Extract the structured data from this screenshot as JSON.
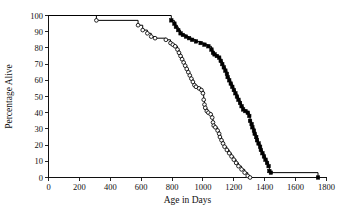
{
  "figure": {
    "background_color": "#ffffff",
    "foreground_color": "#101010"
  },
  "chart_data": {
    "type": "line",
    "title": "",
    "subtitle": "",
    "xlabel": "Age in Days",
    "ylabel": "Percentage Alive",
    "xlim": [
      0,
      1800
    ],
    "ylim": [
      0,
      100
    ],
    "xticks": [
      0,
      200,
      400,
      600,
      800,
      1000,
      1200,
      1400,
      1600,
      1800
    ],
    "yticks": [
      0,
      10,
      20,
      30,
      40,
      50,
      60,
      70,
      80,
      90,
      100
    ],
    "xtick_labels": [
      "0",
      "200",
      "400",
      "600",
      "800",
      "1000",
      "1200",
      "1400",
      "1600",
      "1800"
    ],
    "ytick_labels": [
      "0",
      "10",
      "20",
      "30",
      "40",
      "50",
      "60",
      "70",
      "80",
      "90",
      "100"
    ],
    "grid": false,
    "legend": null,
    "legend_position": "none",
    "annotations": [],
    "series": [
      {
        "name": "Open circles group",
        "marker": "open-circle",
        "line_color": "#000000",
        "marker_fill": "#ffffff",
        "points": [
          {
            "x": 0,
            "y": 100
          },
          {
            "x": 310,
            "y": 97
          },
          {
            "x": 580,
            "y": 94
          },
          {
            "x": 610,
            "y": 91
          },
          {
            "x": 640,
            "y": 89
          },
          {
            "x": 665,
            "y": 87
          },
          {
            "x": 690,
            "y": 86
          },
          {
            "x": 760,
            "y": 85
          },
          {
            "x": 790,
            "y": 83
          },
          {
            "x": 805,
            "y": 82
          },
          {
            "x": 820,
            "y": 81
          },
          {
            "x": 835,
            "y": 79
          },
          {
            "x": 845,
            "y": 77
          },
          {
            "x": 855,
            "y": 75
          },
          {
            "x": 865,
            "y": 73
          },
          {
            "x": 875,
            "y": 71
          },
          {
            "x": 885,
            "y": 69
          },
          {
            "x": 895,
            "y": 67
          },
          {
            "x": 905,
            "y": 65
          },
          {
            "x": 915,
            "y": 63
          },
          {
            "x": 925,
            "y": 61
          },
          {
            "x": 935,
            "y": 59
          },
          {
            "x": 945,
            "y": 57
          },
          {
            "x": 955,
            "y": 56
          },
          {
            "x": 975,
            "y": 55
          },
          {
            "x": 990,
            "y": 54
          },
          {
            "x": 1000,
            "y": 52
          },
          {
            "x": 1005,
            "y": 48
          },
          {
            "x": 1010,
            "y": 45
          },
          {
            "x": 1015,
            "y": 43
          },
          {
            "x": 1025,
            "y": 41
          },
          {
            "x": 1035,
            "y": 40
          },
          {
            "x": 1050,
            "y": 39
          },
          {
            "x": 1060,
            "y": 37
          },
          {
            "x": 1065,
            "y": 34
          },
          {
            "x": 1070,
            "y": 32
          },
          {
            "x": 1080,
            "y": 31
          },
          {
            "x": 1095,
            "y": 29
          },
          {
            "x": 1105,
            "y": 27
          },
          {
            "x": 1110,
            "y": 25
          },
          {
            "x": 1120,
            "y": 23
          },
          {
            "x": 1130,
            "y": 21
          },
          {
            "x": 1140,
            "y": 19
          },
          {
            "x": 1155,
            "y": 17
          },
          {
            "x": 1170,
            "y": 15
          },
          {
            "x": 1185,
            "y": 13
          },
          {
            "x": 1200,
            "y": 11
          },
          {
            "x": 1215,
            "y": 9
          },
          {
            "x": 1230,
            "y": 7
          },
          {
            "x": 1250,
            "y": 5
          },
          {
            "x": 1270,
            "y": 3
          },
          {
            "x": 1290,
            "y": 1
          },
          {
            "x": 1305,
            "y": 0
          }
        ]
      },
      {
        "name": "Filled squares group",
        "marker": "filled-square",
        "line_color": "#000000",
        "marker_fill": "#000000",
        "points": [
          {
            "x": 0,
            "y": 100
          },
          {
            "x": 795,
            "y": 97
          },
          {
            "x": 815,
            "y": 95
          },
          {
            "x": 825,
            "y": 93
          },
          {
            "x": 840,
            "y": 91
          },
          {
            "x": 855,
            "y": 89
          },
          {
            "x": 870,
            "y": 88
          },
          {
            "x": 890,
            "y": 87
          },
          {
            "x": 910,
            "y": 86
          },
          {
            "x": 930,
            "y": 85
          },
          {
            "x": 955,
            "y": 84
          },
          {
            "x": 985,
            "y": 83
          },
          {
            "x": 1010,
            "y": 82
          },
          {
            "x": 1035,
            "y": 81
          },
          {
            "x": 1055,
            "y": 79
          },
          {
            "x": 1065,
            "y": 77
          },
          {
            "x": 1075,
            "y": 76
          },
          {
            "x": 1090,
            "y": 75
          },
          {
            "x": 1105,
            "y": 74
          },
          {
            "x": 1115,
            "y": 72
          },
          {
            "x": 1125,
            "y": 70
          },
          {
            "x": 1135,
            "y": 68
          },
          {
            "x": 1145,
            "y": 66
          },
          {
            "x": 1155,
            "y": 64
          },
          {
            "x": 1160,
            "y": 62
          },
          {
            "x": 1170,
            "y": 60
          },
          {
            "x": 1180,
            "y": 58
          },
          {
            "x": 1190,
            "y": 56
          },
          {
            "x": 1200,
            "y": 54
          },
          {
            "x": 1210,
            "y": 52
          },
          {
            "x": 1220,
            "y": 50
          },
          {
            "x": 1230,
            "y": 48
          },
          {
            "x": 1240,
            "y": 46
          },
          {
            "x": 1250,
            "y": 44
          },
          {
            "x": 1260,
            "y": 42
          },
          {
            "x": 1275,
            "y": 41
          },
          {
            "x": 1290,
            "y": 40
          },
          {
            "x": 1300,
            "y": 38
          },
          {
            "x": 1305,
            "y": 35
          },
          {
            "x": 1315,
            "y": 33
          },
          {
            "x": 1320,
            "y": 31
          },
          {
            "x": 1330,
            "y": 29
          },
          {
            "x": 1335,
            "y": 27
          },
          {
            "x": 1345,
            "y": 25
          },
          {
            "x": 1350,
            "y": 23
          },
          {
            "x": 1360,
            "y": 21
          },
          {
            "x": 1370,
            "y": 19
          },
          {
            "x": 1375,
            "y": 17
          },
          {
            "x": 1385,
            "y": 15
          },
          {
            "x": 1395,
            "y": 13
          },
          {
            "x": 1405,
            "y": 11
          },
          {
            "x": 1415,
            "y": 9
          },
          {
            "x": 1425,
            "y": 7
          },
          {
            "x": 1430,
            "y": 4
          },
          {
            "x": 1440,
            "y": 3
          },
          {
            "x": 1745,
            "y": 0
          }
        ]
      }
    ]
  }
}
